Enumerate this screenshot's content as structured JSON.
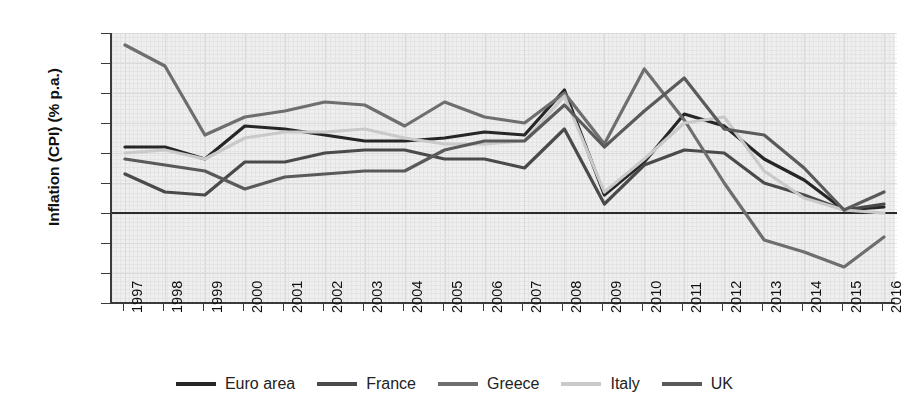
{
  "chart_data": {
    "type": "line",
    "title": "",
    "xlabel": "",
    "ylabel": "Inflation (CPI) (% p.a.)",
    "x": [
      1997,
      1998,
      1999,
      2000,
      2001,
      2002,
      2003,
      2004,
      2005,
      2006,
      2007,
      2008,
      2009,
      2010,
      2011,
      2012,
      2013,
      2014,
      2015,
      2016
    ],
    "categories": [
      "1997",
      "1998",
      "1999",
      "2000",
      "2001",
      "2002",
      "2003",
      "2004",
      "2005",
      "2006",
      "2007",
      "2008",
      "2009",
      "2010",
      "2011",
      "2012",
      "2013",
      "2014",
      "2015",
      "2016"
    ],
    "ylim": [
      -3,
      6
    ],
    "yticks": [
      "6",
      "5",
      "4",
      "3",
      "2",
      "1",
      "0",
      "−1",
      "−2",
      "−3"
    ],
    "ytick_values": [
      6,
      5,
      4,
      3,
      2,
      1,
      0,
      -1,
      -2,
      -3
    ],
    "xlim": [
      1997,
      2016
    ],
    "grid": true,
    "legend_position": "bottom",
    "zero_line": 0,
    "series": [
      {
        "name": "Euro area",
        "color": "#262626",
        "values": [
          2.2,
          2.2,
          1.8,
          2.9,
          2.8,
          2.6,
          2.4,
          2.4,
          2.5,
          2.7,
          2.6,
          4.1,
          0.6,
          1.7,
          3.3,
          2.9,
          1.8,
          1.1,
          0.1,
          0.2
        ]
      },
      {
        "name": "France",
        "color": "#4a4a4a",
        "values": [
          1.3,
          0.7,
          0.6,
          1.7,
          1.7,
          2.0,
          2.1,
          2.1,
          1.8,
          1.8,
          1.5,
          2.8,
          0.3,
          1.6,
          2.1,
          2.0,
          1.0,
          0.6,
          0.1,
          0.3
        ]
      },
      {
        "name": "Greece",
        "color": "#6e6e6e",
        "values": [
          5.6,
          4.9,
          2.6,
          3.2,
          3.4,
          3.7,
          3.6,
          2.9,
          3.7,
          3.2,
          3.0,
          4.0,
          2.3,
          4.8,
          3.1,
          1.0,
          -0.9,
          -1.3,
          -1.8,
          -0.8
        ]
      },
      {
        "name": "Italy",
        "color": "#c9c9c9",
        "values": [
          2.0,
          2.1,
          1.8,
          2.5,
          2.7,
          2.7,
          2.8,
          2.5,
          2.3,
          2.3,
          2.4,
          3.9,
          0.7,
          1.8,
          3.0,
          3.2,
          1.4,
          0.5,
          0.1,
          0.0
        ]
      },
      {
        "name": "UK",
        "color": "#5a5a5a",
        "values": [
          1.8,
          1.6,
          1.4,
          0.8,
          1.2,
          1.3,
          1.4,
          1.4,
          2.1,
          2.4,
          2.4,
          3.6,
          2.2,
          3.4,
          4.5,
          2.8,
          2.6,
          1.5,
          0.1,
          0.7
        ]
      }
    ]
  }
}
